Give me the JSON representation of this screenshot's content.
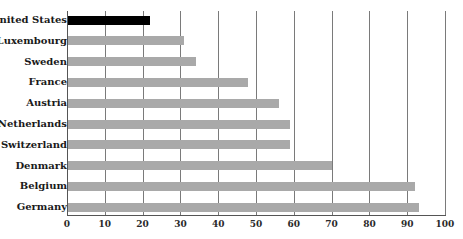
{
  "chart_data": {
    "type": "bar",
    "orientation": "horizontal",
    "title": "",
    "xlabel": "",
    "ylabel": "",
    "categories": [
      "United States",
      "Luxembourg",
      "Sweden",
      "France",
      "Austria",
      "Netherlands",
      "Switzerland",
      "Denmark",
      "Belgium",
      "Germany"
    ],
    "values": [
      22,
      31,
      34,
      48,
      56,
      59,
      59,
      70,
      92,
      93
    ],
    "highlight": "United States",
    "xlim": [
      0,
      100
    ],
    "xticks": [
      0,
      10,
      20,
      30,
      40,
      50,
      60,
      70,
      80,
      90,
      100
    ],
    "grid": "vertical",
    "legend": "none",
    "colors": {
      "highlight": "#000000",
      "default": "#a9a9a9",
      "grid": "#7a7a7a"
    }
  }
}
